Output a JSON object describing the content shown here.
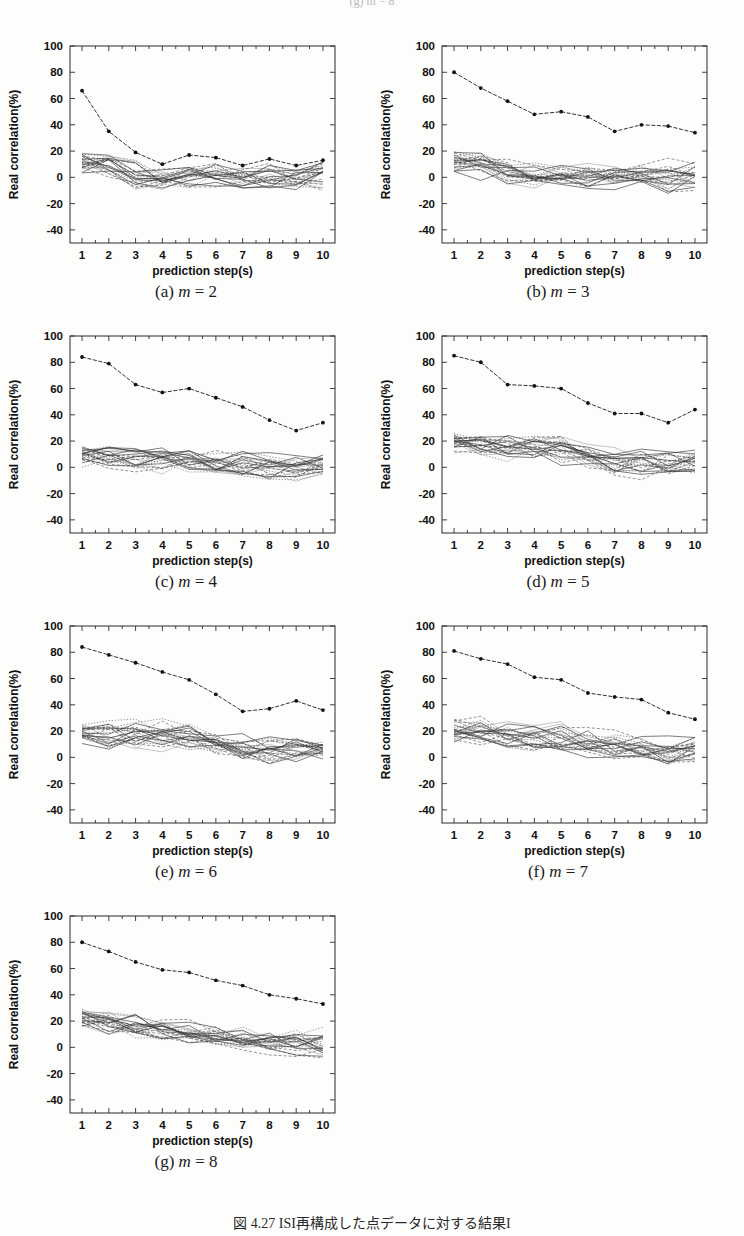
{
  "header": {
    "clipped_text": "(g) m = 8"
  },
  "bottom_caption": {
    "text": "図 4.27  ISI再構成した点データに対する結果I"
  },
  "axes": {
    "xlabel": "prediction step(s)",
    "ylabel": "Real correlation(%)",
    "xticks": [
      "1",
      "2",
      "3",
      "4",
      "5",
      "6",
      "7",
      "8",
      "9",
      "10"
    ],
    "yticks": [
      "100",
      "80",
      "60",
      "40",
      "20",
      "0",
      "-20",
      "-40"
    ],
    "xlim": [
      0.55,
      10.45
    ],
    "ylim": [
      -50,
      100
    ]
  },
  "chart_data": [
    {
      "type": "line",
      "panel": "a",
      "caption_prefix": "(a)",
      "caption_var": "m",
      "caption_value": "= 2",
      "title": "(a) m = 2",
      "xlabel": "prediction step(s)",
      "ylabel": "Real correlation(%)",
      "x": [
        1,
        2,
        3,
        4,
        5,
        6,
        7,
        8,
        9,
        10
      ],
      "xlim": [
        0.55,
        10.45
      ],
      "ylim": [
        -50,
        100
      ],
      "grid": false,
      "legend": "none",
      "series": [
        {
          "name": "ISI reconstruction (marked)",
          "marker": "dot",
          "values": [
            66,
            35,
            19,
            10,
            17,
            15,
            9,
            14,
            9,
            13
          ]
        }
      ],
      "surrogate_band": {
        "name": "surrogate ensemble",
        "count": 24,
        "center": [
          11,
          10,
          2,
          0,
          1,
          2,
          0,
          1,
          0,
          3
        ],
        "spread": [
          7,
          8,
          8,
          7,
          7,
          8,
          7,
          8,
          8,
          9
        ]
      }
    },
    {
      "type": "line",
      "panel": "b",
      "caption_prefix": "(b)",
      "caption_var": "m",
      "caption_value": "= 3",
      "title": "(b) m = 3",
      "xlabel": "prediction step(s)",
      "ylabel": "Real correlation(%)",
      "x": [
        1,
        2,
        3,
        4,
        5,
        6,
        7,
        8,
        9,
        10
      ],
      "xlim": [
        0.55,
        10.45
      ],
      "ylim": [
        -50,
        100
      ],
      "grid": false,
      "legend": "none",
      "series": [
        {
          "name": "ISI reconstruction (marked)",
          "marker": "dot",
          "values": [
            80,
            68,
            58,
            48,
            50,
            46,
            35,
            40,
            39,
            34
          ]
        }
      ],
      "surrogate_band": {
        "name": "surrogate ensemble",
        "count": 24,
        "center": [
          11,
          9,
          5,
          2,
          3,
          1,
          0,
          1,
          -1,
          2
        ],
        "spread": [
          7,
          8,
          8,
          8,
          8,
          8,
          7,
          7,
          10,
          9
        ]
      }
    },
    {
      "type": "line",
      "panel": "c",
      "caption_prefix": "(c)",
      "caption_var": "m",
      "caption_value": "= 4",
      "title": "(c) m = 4",
      "xlabel": "prediction step(s)",
      "ylabel": "Real correlation(%)",
      "x": [
        1,
        2,
        3,
        4,
        5,
        6,
        7,
        8,
        9,
        10
      ],
      "xlim": [
        0.55,
        10.45
      ],
      "ylim": [
        -50,
        100
      ],
      "grid": false,
      "legend": "none",
      "series": [
        {
          "name": "ISI reconstruction (marked)",
          "marker": "dot",
          "values": [
            84,
            79,
            63,
            57,
            60,
            53,
            46,
            36,
            28,
            34
          ]
        }
      ],
      "surrogate_band": {
        "name": "surrogate ensemble",
        "count": 24,
        "center": [
          10,
          8,
          5,
          4,
          4,
          2,
          3,
          1,
          0,
          2
        ],
        "spread": [
          7,
          7,
          8,
          8,
          9,
          8,
          9,
          8,
          7,
          6
        ]
      }
    },
    {
      "type": "line",
      "panel": "d",
      "caption_prefix": "(d)",
      "caption_var": "m",
      "caption_value": "= 5",
      "title": "(d) m = 5",
      "xlabel": "prediction step(s)",
      "ylabel": "Real correlation(%)",
      "x": [
        1,
        2,
        3,
        4,
        5,
        6,
        7,
        8,
        9,
        10
      ],
      "xlim": [
        0.55,
        10.45
      ],
      "ylim": [
        -50,
        100
      ],
      "grid": false,
      "legend": "none",
      "series": [
        {
          "name": "ISI reconstruction (marked)",
          "marker": "dot",
          "values": [
            85,
            80,
            63,
            62,
            60,
            49,
            41,
            41,
            34,
            44
          ]
        }
      ],
      "surrogate_band": {
        "name": "surrogate ensemble",
        "count": 24,
        "center": [
          19,
          17,
          15,
          16,
          13,
          8,
          3,
          3,
          3,
          4
        ],
        "spread": [
          7,
          8,
          9,
          10,
          10,
          9,
          9,
          9,
          9,
          7
        ]
      }
    },
    {
      "type": "line",
      "panel": "e",
      "caption_prefix": "(e)",
      "caption_var": "m",
      "caption_value": "= 6",
      "title": "(e) m = 6",
      "xlabel": "prediction step(s)",
      "ylabel": "Real correlation(%)",
      "x": [
        1,
        2,
        3,
        4,
        5,
        6,
        7,
        8,
        9,
        10
      ],
      "xlim": [
        0.55,
        10.45
      ],
      "ylim": [
        -50,
        100
      ],
      "grid": false,
      "legend": "none",
      "series": [
        {
          "name": "ISI reconstruction (marked)",
          "marker": "dot",
          "values": [
            84,
            78,
            72,
            65,
            59,
            48,
            35,
            37,
            43,
            36
          ]
        }
      ],
      "surrogate_band": {
        "name": "surrogate ensemble",
        "count": 24,
        "center": [
          20,
          18,
          16,
          17,
          15,
          9,
          7,
          5,
          6,
          7
        ],
        "spread": [
          9,
          10,
          9,
          9,
          9,
          8,
          9,
          9,
          8,
          7
        ]
      }
    },
    {
      "type": "line",
      "panel": "f",
      "caption_prefix": "(f)",
      "caption_var": "m",
      "caption_value": "= 7",
      "title": "(f) m = 7",
      "xlabel": "prediction step(s)",
      "ylabel": "Real correlation(%)",
      "x": [
        1,
        2,
        3,
        4,
        5,
        6,
        7,
        8,
        9,
        10
      ],
      "xlim": [
        0.55,
        10.45
      ],
      "ylim": [
        -50,
        100
      ],
      "grid": false,
      "legend": "none",
      "series": [
        {
          "name": "ISI reconstruction (marked)",
          "marker": "dot",
          "values": [
            81,
            75,
            71,
            61,
            59,
            49,
            46,
            44,
            34,
            29
          ]
        }
      ],
      "surrogate_band": {
        "name": "surrogate ensemble",
        "count": 24,
        "center": [
          20,
          19,
          17,
          15,
          14,
          10,
          8,
          5,
          3,
          7
        ],
        "spread": [
          7,
          9,
          9,
          10,
          9,
          10,
          9,
          8,
          8,
          8
        ]
      }
    },
    {
      "type": "line",
      "panel": "g",
      "caption_prefix": "(g)",
      "caption_var": "m",
      "caption_value": "= 8",
      "title": "(g) m = 8",
      "xlabel": "prediction step(s)",
      "ylabel": "Real correlation(%)",
      "x": [
        1,
        2,
        3,
        4,
        5,
        6,
        7,
        8,
        9,
        10
      ],
      "xlim": [
        0.55,
        10.45
      ],
      "ylim": [
        -50,
        100
      ],
      "grid": false,
      "legend": "none",
      "series": [
        {
          "name": "ISI reconstruction (marked)",
          "marker": "dot",
          "values": [
            80,
            73,
            65,
            59,
            57,
            51,
            47,
            40,
            37,
            33
          ]
        }
      ],
      "surrogate_band": {
        "name": "surrogate ensemble",
        "count": 24,
        "center": [
          21,
          18,
          16,
          14,
          12,
          9,
          7,
          4,
          4,
          4
        ],
        "spread": [
          7,
          8,
          9,
          9,
          8,
          8,
          8,
          7,
          8,
          9
        ]
      }
    }
  ]
}
